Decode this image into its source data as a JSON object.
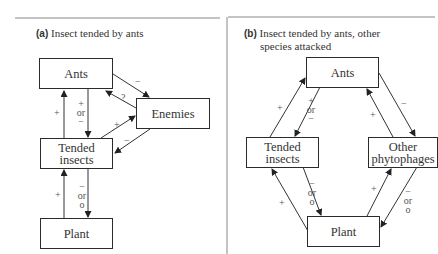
{
  "panel_a": {
    "tag": "(a)",
    "title": "Insect tended by ants",
    "nodes": {
      "ants": "Ants",
      "enemies": "Enemies",
      "tended_line1": "Tended",
      "tended_line2": "insects",
      "plant": "Plant"
    },
    "edges": {
      "tended_to_ants": "+",
      "ants_to_tended_1": "+",
      "ants_to_tended_2": "or",
      "ants_to_tended_3": "−",
      "ants_to_enemies": "−",
      "enemies_to_ants": "?",
      "tended_to_enemies": "+",
      "enemies_to_tended": "−",
      "plant_to_tended": "+",
      "tended_to_plant_1": "−",
      "tended_to_plant_2": "or",
      "tended_to_plant_3": "o"
    }
  },
  "panel_b": {
    "tag": "(b)",
    "title_line1": "Insect tended by ants, other",
    "title_line2": "species attacked",
    "nodes": {
      "ants": "Ants",
      "tended_line1": "Tended",
      "tended_line2": "insects",
      "other_line1": "Other",
      "other_line2": "phytophages",
      "plant": "Plant"
    },
    "edges": {
      "tended_to_ants": "+",
      "ants_to_tended_1": "+",
      "ants_to_tended_2": "or",
      "ants_to_tended_3": "−",
      "other_to_ants": "+",
      "ants_to_other": "−",
      "plant_to_tended": "+",
      "tended_to_plant_1": "−",
      "tended_to_plant_2": "or",
      "tended_to_plant_3": "o",
      "plant_to_other": "+",
      "other_to_plant_1": "−",
      "other_to_plant_2": "or",
      "other_to_plant_3": "o"
    }
  }
}
